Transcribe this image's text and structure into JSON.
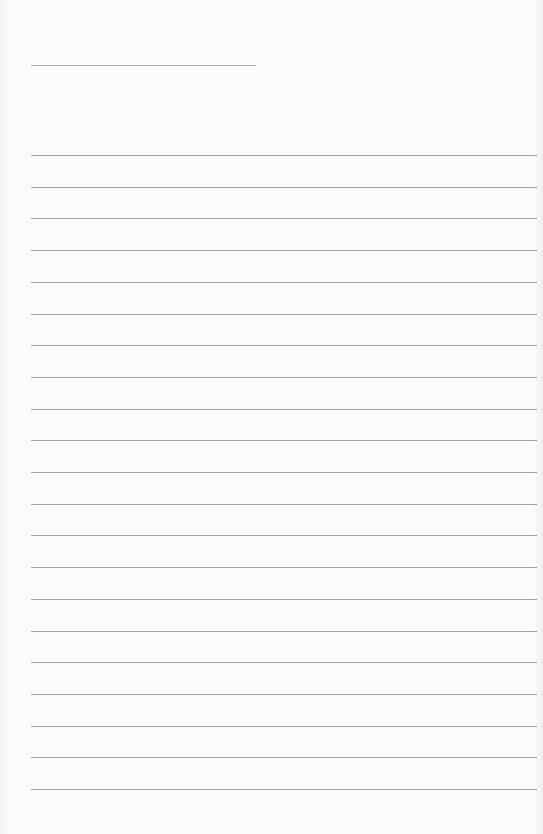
{
  "page": {
    "type": "blank lined paper",
    "header_line": {
      "present": true
    },
    "ruled_lines": {
      "count": 21
    },
    "colors": {
      "paper": "#fbfbfb",
      "line": "#a4a4a4"
    }
  }
}
